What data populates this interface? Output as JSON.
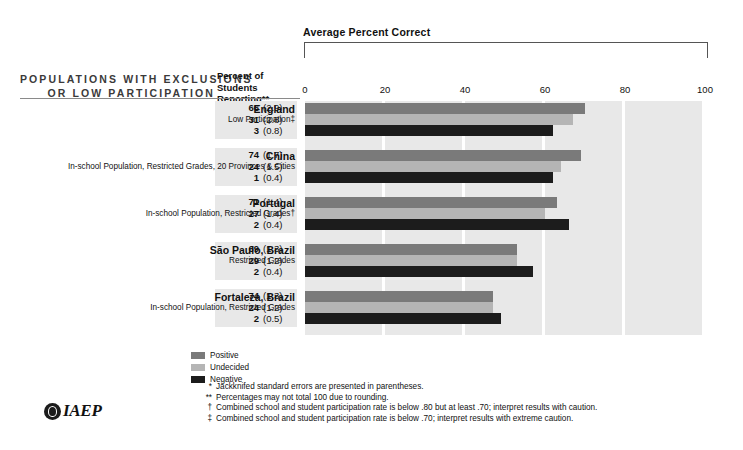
{
  "chart_data": {
    "type": "bar",
    "title": "Average Percent Correct",
    "xlabel": "",
    "ylabel": "",
    "xlim": [
      0,
      100
    ],
    "ticks": [
      0,
      20,
      40,
      60,
      80,
      100
    ],
    "grid": false,
    "legend_position": "bottom-left",
    "orientation": "horizontal",
    "series": [
      {
        "name": "Positive",
        "color": "#7a7a7a",
        "values": [
          70,
          69,
          63,
          53,
          47
        ]
      },
      {
        "name": "Undecided",
        "color": "#b5b5b5",
        "values": [
          67,
          64,
          60,
          53,
          47
        ]
      },
      {
        "name": "Negative",
        "color": "#1c1c1c",
        "values": [
          62,
          62,
          66,
          57,
          49
        ]
      }
    ],
    "categories": [
      "England",
      "China",
      "Portugal",
      "São Paulo, Brazil",
      "Fortaleza, Brazil"
    ]
  },
  "header": {
    "title_line1": "POPULATIONS WITH EXCLUSIONS",
    "title_line2": "OR LOW PARTICIPATION",
    "column_line1": "Percent of",
    "column_line2": "Students Reporting**"
  },
  "chart": {
    "title": "Average Percent Correct",
    "ticks": [
      "0",
      "20",
      "40",
      "60",
      "80",
      "100"
    ]
  },
  "rows": [
    {
      "country": "England",
      "subtitle": "Low Participation‡",
      "values": [
        {
          "pct": "66",
          "se": "(2.9)"
        },
        {
          "pct": "31",
          "se": "(2.8)"
        },
        {
          "pct": "3",
          "se": "(0.8)"
        }
      ]
    },
    {
      "country": "China",
      "subtitle": "In-school Population, Restricted Grades, 20 Provinces & Cities",
      "values": [
        {
          "pct": "74",
          "se": "(1.7)"
        },
        {
          "pct": "24",
          "se": "(1.5)"
        },
        {
          "pct": "1",
          "se": "(0.4)"
        }
      ]
    },
    {
      "country": "Portugal",
      "subtitle": "In-school Population, Restricted  Grades†",
      "values": [
        {
          "pct": "71",
          "se": "(1.4)"
        },
        {
          "pct": "27",
          "se": "(1.4)"
        },
        {
          "pct": "2",
          "se": "(0.4)"
        }
      ]
    },
    {
      "country": "São Paulo, Brazil",
      "subtitle": "Restricted Grades",
      "values": [
        {
          "pct": "69",
          "se": "(1.3)"
        },
        {
          "pct": "29",
          "se": "(1.2)"
        },
        {
          "pct": "2",
          "se": "(0.4)"
        }
      ]
    },
    {
      "country": "Fortaleza, Brazil",
      "subtitle": "In-school Population, Restricted Grades",
      "values": [
        {
          "pct": "74",
          "se": "(1.3)"
        },
        {
          "pct": "24",
          "se": "(1.2)"
        },
        {
          "pct": "2",
          "se": "(0.5)"
        }
      ]
    }
  ],
  "legend": [
    {
      "label": "Positive",
      "color": "#7a7a7a"
    },
    {
      "label": "Undecided",
      "color": "#b5b5b5"
    },
    {
      "label": "Negative",
      "color": "#1c1c1c"
    }
  ],
  "footnotes": [
    {
      "mark": "*",
      "text": "Jackknifed standard errors are presented in parentheses."
    },
    {
      "mark": "**",
      "text": "Percentages may not total 100 due to rounding."
    },
    {
      "mark": "†",
      "text": "Combined school and student participation rate is below .80 but at least .70; interpret results with caution."
    },
    {
      "mark": "‡",
      "text": "Combined school and student participation rate is below .70; interpret results with extreme caution."
    }
  ],
  "logo": {
    "text": "IAEP",
    "mark": "iaep-globe-icon"
  }
}
